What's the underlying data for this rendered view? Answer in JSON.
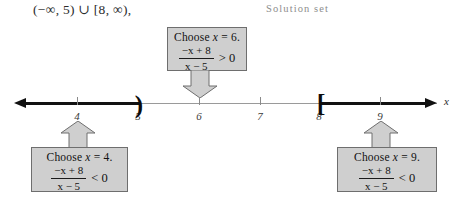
{
  "interval_notation": "(−∞, 5) ∪ [8, ∞),",
  "solution_set_caption": "Solution set",
  "number_line": {
    "axis_variable": "x",
    "ticks": [
      {
        "value": "4",
        "x": 77
      },
      {
        "value": "5",
        "x": 138
      },
      {
        "value": "6",
        "x": 199
      },
      {
        "value": "7",
        "x": 260
      },
      {
        "value": "8",
        "x": 319
      },
      {
        "value": "9",
        "x": 380
      }
    ],
    "endpoints": [
      {
        "glyph": ")",
        "at": "5",
        "type": "open"
      },
      {
        "glyph": "[",
        "at": "8",
        "type": "closed"
      }
    ],
    "shaded_segments": [
      {
        "from": "-infinity",
        "to": "5"
      },
      {
        "from": "8",
        "to": "+infinity"
      }
    ]
  },
  "callouts": {
    "left": {
      "heading_prefix": "Choose ",
      "heading_var": "x",
      "heading_suffix": " = 4.",
      "numerator": "−x + 8",
      "denominator": "x − 5",
      "relation": "< 0",
      "test_value": "4"
    },
    "center": {
      "heading_prefix": "Choose ",
      "heading_var": "x",
      "heading_suffix": " = 6.",
      "numerator": "−x + 8",
      "denominator": "x − 5",
      "relation": "> 0",
      "test_value": "6"
    },
    "right": {
      "heading_prefix": "Choose ",
      "heading_var": "x",
      "heading_suffix": " = 9.",
      "numerator": "−x + 8",
      "denominator": "x − 5",
      "relation": "< 0",
      "test_value": "9"
    }
  },
  "colors": {
    "callout_fill": "#cfcfcf",
    "callout_border": "#6e6e6e",
    "axis": "#9a9a9a",
    "shaded": "#111111",
    "caption": "#8d8d8d"
  }
}
